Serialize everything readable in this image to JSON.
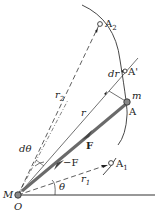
{
  "diagram": {
    "type": "central-force orbit geometry",
    "labels": {
      "A2": "A",
      "A2_sub": "2",
      "A_prime": "A'",
      "dr": "dr",
      "m": "m",
      "A": "A",
      "r": "r",
      "r2": "r",
      "r2_sub": "2",
      "F": "F",
      "neg_F": "−F",
      "A1": "A",
      "A1_sub": "1",
      "r1": "r",
      "r1_sub": "1",
      "d_theta": "dθ",
      "theta": "θ",
      "M": "M",
      "O": "O"
    },
    "colors": {
      "line": "#333333",
      "force_vector": "#666666",
      "background": "#ffffff"
    }
  }
}
